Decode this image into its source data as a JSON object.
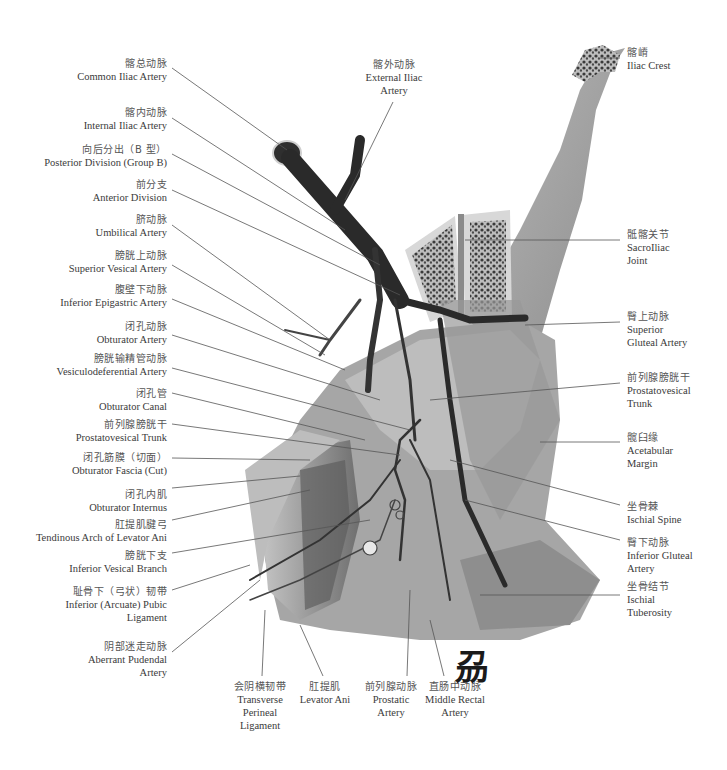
{
  "figure": {
    "logo": "刕",
    "colors": {
      "artery": "#2a2a2a",
      "bone": "#9a9a9a",
      "cancellous": "#3a3a3a",
      "muscle": "#7a7a7a",
      "leader": "#555555"
    }
  },
  "labels_left": [
    {
      "zh": "髂总动脉",
      "en": [
        "Common Iliac Artery"
      ]
    },
    {
      "zh": "髂内动脉",
      "en": [
        "Internal Iliac Artery"
      ]
    },
    {
      "zh": "向后分出（B 型）",
      "en": [
        "Posterior Division (Group B)"
      ]
    },
    {
      "zh": "前分支",
      "en": [
        "Anterior Division"
      ]
    },
    {
      "zh": "脐动脉",
      "en": [
        "Umbilical Artery"
      ]
    },
    {
      "zh": "膀胱上动脉",
      "en": [
        "Superior Vesical Artery"
      ]
    },
    {
      "zh": "腹壁下动脉",
      "en": [
        "Inferior Epigastric Artery"
      ]
    },
    {
      "zh": "闭孔动脉",
      "en": [
        "Obturator Artery"
      ]
    },
    {
      "zh": "膀胱输精管动脉",
      "en": [
        "Vesiculodeferential Artery"
      ]
    },
    {
      "zh": "闭孔管",
      "en": [
        "Obturator Canal"
      ]
    },
    {
      "zh": "前列腺膀胱干",
      "en": [
        "Prostatovesical Trunk"
      ]
    },
    {
      "zh": "闭孔筋膜（切面）",
      "en": [
        "Obturator Fascia (Cut)"
      ]
    },
    {
      "zh": "闭孔内肌",
      "en": [
        "Obturator Internus"
      ]
    },
    {
      "zh": "肛提肌腱弓",
      "en": [
        "Tendinous Arch of Levator Ani"
      ]
    },
    {
      "zh": "膀胱下支",
      "en": [
        "Inferior Vesical Branch"
      ]
    },
    {
      "zh": "耻骨下（弓状）韧带",
      "en": [
        "Inferior (Arcuate) Pubic",
        "Ligament"
      ]
    },
    {
      "zh": "阴部迷走动脉",
      "en": [
        "Aberrant Pudendal",
        "Artery"
      ]
    }
  ],
  "labels_top": [
    {
      "zh": "髂外动脉",
      "en": [
        "External Iliac",
        "Artery"
      ]
    }
  ],
  "labels_right": [
    {
      "zh": "髂嵴",
      "en": [
        "Iliac Crest"
      ]
    },
    {
      "zh": "骶髂关节",
      "en": [
        "SacroIliac",
        "Joint"
      ]
    },
    {
      "zh": "臀上动脉",
      "en": [
        "Superior",
        "Gluteal Artery"
      ]
    },
    {
      "zh": "前列腺膀胱干",
      "en": [
        "Prostatovesical",
        "Trunk"
      ]
    },
    {
      "zh": "髋臼缘",
      "en": [
        "Acetabular",
        "Margin"
      ]
    },
    {
      "zh": "坐骨棘",
      "en": [
        "Ischial Spine"
      ]
    },
    {
      "zh": "臀下动脉",
      "en": [
        "Inferior Gluteal",
        "Artery"
      ]
    },
    {
      "zh": "坐骨结节",
      "en": [
        "Ischial",
        "Tuberosity"
      ]
    }
  ],
  "labels_bottom": [
    {
      "zh": "会阴横韧带",
      "en": [
        "Transverse",
        "Perineal",
        "Ligament"
      ]
    },
    {
      "zh": "肛提肌",
      "en": [
        "Levator Ani"
      ]
    },
    {
      "zh": "前列腺动脉",
      "en": [
        "Prostatic",
        "Artery"
      ]
    },
    {
      "zh": "直肠中动脉",
      "en": [
        "Middle Rectal",
        "Artery"
      ]
    }
  ]
}
